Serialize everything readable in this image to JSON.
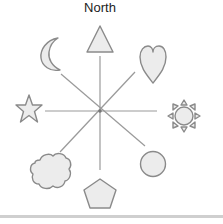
{
  "diagram": {
    "title": "North",
    "center": {
      "x": 100,
      "y": 111
    },
    "colors": {
      "stroke": "#8a8a8a",
      "fill": "#ececec",
      "line": "#9a9a9a",
      "band": "#cfcfcf"
    },
    "shapes": [
      {
        "name": "triangle",
        "direction": "N"
      },
      {
        "name": "heart",
        "direction": "NE"
      },
      {
        "name": "sun",
        "direction": "E"
      },
      {
        "name": "circle",
        "direction": "SE"
      },
      {
        "name": "pentagon",
        "direction": "S"
      },
      {
        "name": "cloud",
        "direction": "SW"
      },
      {
        "name": "star",
        "direction": "W"
      },
      {
        "name": "moon",
        "direction": "NW"
      }
    ]
  }
}
